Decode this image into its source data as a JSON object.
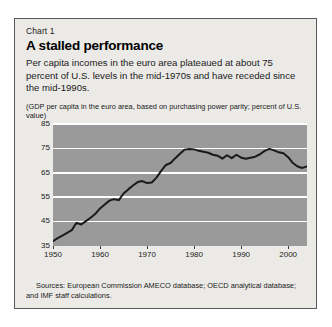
{
  "card": {
    "kicker": "Chart 1",
    "headline": "A stalled performance",
    "deck": "Per capita incomes in the euro area plateaued at about 75 percent of U.S. levels in the mid-1970s and have receded since the mid-1990s.",
    "axis_note": "(GDP per capita in the euro area, based on purchasing power parity; percent of U.S. value)",
    "sources": "Sources: European Commission AMECO database; OECD analytical database; and IMF staff calculations."
  },
  "colors": {
    "card_background": "#eceae7",
    "card_border": "#5a5a5a",
    "plot_background": "#9a9a9a",
    "gridline": "#ffffff",
    "series_line": "#1a1a1a",
    "text": "#1a1a1a"
  },
  "chart_data": {
    "type": "line",
    "title": "A stalled performance",
    "subtitle": "(GDP per capita in the euro area, based on purchasing power parity; percent of U.S. value)",
    "xlabel": "",
    "ylabel": "",
    "xlim": [
      1950,
      2004
    ],
    "ylim": [
      35,
      85
    ],
    "yticks": [
      35,
      45,
      55,
      65,
      75,
      85
    ],
    "xticks": [
      1950,
      1960,
      1970,
      1980,
      1990,
      2000
    ],
    "grid": "horizontal",
    "legend": "none",
    "series": [
      {
        "name": "Euro area GDP per capita, percent of U.S. value",
        "x": [
          1950,
          1951,
          1952,
          1953,
          1954,
          1955,
          1956,
          1957,
          1958,
          1959,
          1960,
          1961,
          1962,
          1963,
          1964,
          1965,
          1966,
          1967,
          1968,
          1969,
          1970,
          1971,
          1972,
          1973,
          1974,
          1975,
          1976,
          1977,
          1978,
          1979,
          1980,
          1981,
          1982,
          1983,
          1984,
          1985,
          1986,
          1987,
          1988,
          1989,
          1990,
          1991,
          1992,
          1993,
          1994,
          1995,
          1996,
          1997,
          1998,
          1999,
          2000,
          2001,
          2002,
          2003,
          2004
        ],
        "values": [
          37.0,
          38.2,
          39.3,
          40.4,
          41.5,
          44.5,
          43.8,
          45.2,
          46.6,
          48.2,
          50.4,
          52.0,
          53.6,
          54.2,
          53.8,
          56.5,
          58.2,
          59.8,
          61.2,
          61.6,
          60.8,
          61.0,
          63.0,
          65.8,
          68.2,
          69.0,
          71.0,
          72.8,
          74.5,
          74.8,
          74.6,
          74.0,
          73.6,
          73.2,
          72.4,
          72.0,
          70.8,
          72.2,
          71.0,
          72.4,
          71.2,
          70.8,
          71.2,
          71.6,
          72.6,
          74.0,
          74.8,
          74.2,
          73.4,
          73.0,
          71.4,
          69.0,
          67.6,
          67.0,
          67.6
        ]
      }
    ]
  }
}
